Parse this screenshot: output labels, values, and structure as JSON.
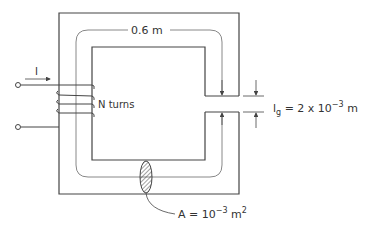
{
  "diagram": {
    "type": "magnetic-circuit",
    "labels": {
      "mean_length": "0.6 m",
      "current": "I",
      "turns": "N turns",
      "gap_symbol": "l",
      "gap_subscript": "g",
      "gap_value": " = 2 x 10",
      "gap_exp": "−3",
      "gap_unit": " m",
      "area_prefix": "A = 10",
      "area_exp": "−3",
      "area_unit": " m",
      "area_unit_exp": "2"
    },
    "colors": {
      "line": "#444444",
      "mean_path": "#888888",
      "background": "#ffffff"
    }
  }
}
